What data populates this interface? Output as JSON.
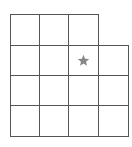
{
  "board": {
    "col_x": [
      10,
      39,
      68,
      98,
      128
    ],
    "row_y": [
      14,
      45,
      75,
      105,
      136
    ],
    "line_color": "#555555",
    "rows": [
      {
        "cells": [
          0,
          1,
          2
        ]
      },
      {
        "cells": [
          0,
          1,
          2,
          3
        ]
      },
      {
        "cells": [
          0,
          1,
          2,
          3
        ]
      },
      {
        "cells": [
          0,
          1,
          2,
          3
        ]
      }
    ],
    "marker": {
      "icon": "star-icon",
      "row": 1,
      "col": 2,
      "color": "#888888"
    }
  }
}
